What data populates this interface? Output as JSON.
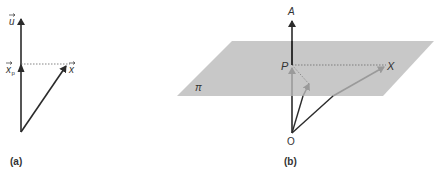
{
  "figure_a": {
    "caption": "(a)",
    "labels": {
      "u": "u",
      "xp": "x",
      "xp_sub": "p",
      "x": "x"
    }
  },
  "figure_b": {
    "caption": "(b)",
    "labels": {
      "A": "A",
      "P": "P",
      "X": "X",
      "O": "O",
      "plane": "π"
    }
  },
  "colors": {
    "line": "#2b2b2b",
    "plane": "#c8c8c8",
    "projection": "#9a9a9a",
    "dotted": "#777777"
  }
}
